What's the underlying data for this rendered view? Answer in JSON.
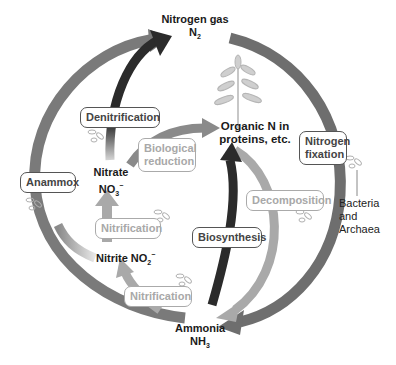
{
  "diagram": {
    "nodes": {
      "nitrogen_gas": {
        "name": "Nitrogen gas",
        "formula": "N",
        "sub": "2"
      },
      "organic_n": {
        "line1": "Organic N in",
        "line2": "proteins, etc."
      },
      "nitrate": {
        "name": "Nitrate",
        "formula": "NO",
        "sub": "3",
        "sup": "−"
      },
      "nitrite": {
        "name": "Nitrite NO",
        "sub": "2",
        "sup": "−"
      },
      "ammonia": {
        "name": "Ammonia",
        "formula": "NH",
        "sub": "3"
      }
    },
    "processes": {
      "denitrification": "Denitrification",
      "biological_reduction_1": "Biological",
      "biological_reduction_2": "reduction",
      "nitrogen_fixation_1": "Nitrogen",
      "nitrogen_fixation_2": "fixation",
      "anammox": "Anammox",
      "nitrification_upper": "Nitrification",
      "nitrification_lower": "Nitrification",
      "biosynthesis": "Biosynthesis",
      "decomposition": "Decomposition"
    },
    "annotation": {
      "line1": "Bacteria",
      "line2": "and",
      "line3": "Archaea"
    },
    "colors": {
      "dark_arrow": "#2b2b2b",
      "mid_arrow": "#6e6e6e",
      "light_arrow": "#a9a9a9",
      "box_border_dark": "#555555",
      "box_border_light": "#aaaaaa"
    }
  }
}
